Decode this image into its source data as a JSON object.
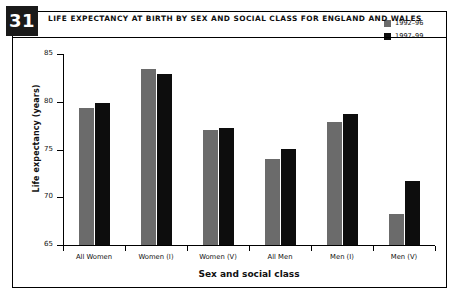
{
  "figure": {
    "number": "31",
    "title": "LIFE EXPECTANCY AT BIRTH BY SEX AND SOCIAL CLASS FOR ENGLAND AND WALES"
  },
  "legend": {
    "position": "top-right",
    "items": [
      {
        "label": "1992–96",
        "color": "#6b6b6b"
      },
      {
        "label": "1997–99",
        "color": "#0d0d0d"
      }
    ]
  },
  "axes": {
    "y_label": "Life expectancy (years)",
    "x_label": "Sex and social class",
    "y_ticks": [
      "65",
      "70",
      "75",
      "80",
      "85"
    ],
    "y_min": 65,
    "y_max": 85
  },
  "colors": {
    "series_a": "#6b6b6b",
    "series_b": "#0d0d0d",
    "badge_background": "#1a1a1a",
    "badge_text": "#ffffff",
    "frame": "#000000",
    "background": "#ffffff"
  },
  "chart_data": {
    "type": "bar",
    "title": "LIFE EXPECTANCY AT BIRTH BY SEX AND SOCIAL CLASS FOR ENGLAND AND WALES",
    "xlabel": "Sex and social class",
    "ylabel": "Life expectancy (years)",
    "ylim": [
      65,
      85
    ],
    "yticks": [
      65,
      70,
      75,
      80,
      85
    ],
    "grid": false,
    "legend_position": "top-right",
    "categories": [
      "All Women",
      "Women (I)",
      "Women (V)",
      "All Men",
      "Men (I)",
      "Men (V)"
    ],
    "series": [
      {
        "name": "1992–96",
        "color": "#6b6b6b",
        "values": [
          79.3,
          83.4,
          77.0,
          74.0,
          77.9,
          68.2
        ]
      },
      {
        "name": "1997–99",
        "color": "#0d0d0d",
        "values": [
          79.9,
          82.9,
          77.2,
          75.1,
          78.7,
          71.7
        ]
      }
    ]
  }
}
